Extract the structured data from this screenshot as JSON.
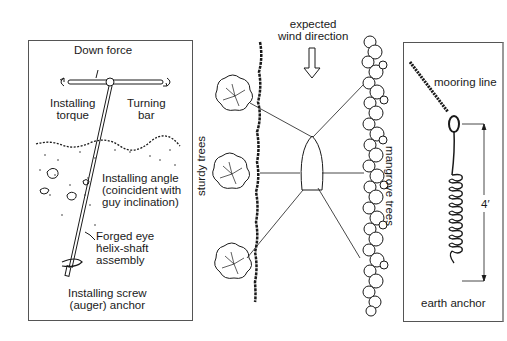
{
  "left_panel": {
    "labels": {
      "down_force": "Down force",
      "installing_torque_1": "Installing",
      "installing_torque_2": "torque",
      "turning_bar_1": "Turning",
      "turning_bar_2": "bar",
      "installing_angle_1": "Installing angle",
      "installing_angle_2": "(coincident with",
      "installing_angle_3": "guy inclination)",
      "forged_eye_1": "Forged eye",
      "forged_eye_2": "helix-shaft",
      "forged_eye_3": "assembly",
      "caption_1": "Installing screw",
      "caption_2": "(auger) anchor"
    }
  },
  "middle_panel": {
    "labels": {
      "wind_1": "expected",
      "wind_2": "wind direction",
      "sturdy_trees": "sturdy trees",
      "mangrove_trees": "mangrove trees"
    }
  },
  "right_panel": {
    "labels": {
      "mooring_line": "mooring line",
      "length": "4′",
      "caption": "earth anchor"
    }
  },
  "colors": {
    "ink": "#1a1a1a",
    "frame": "#555555",
    "background": "#ffffff"
  }
}
